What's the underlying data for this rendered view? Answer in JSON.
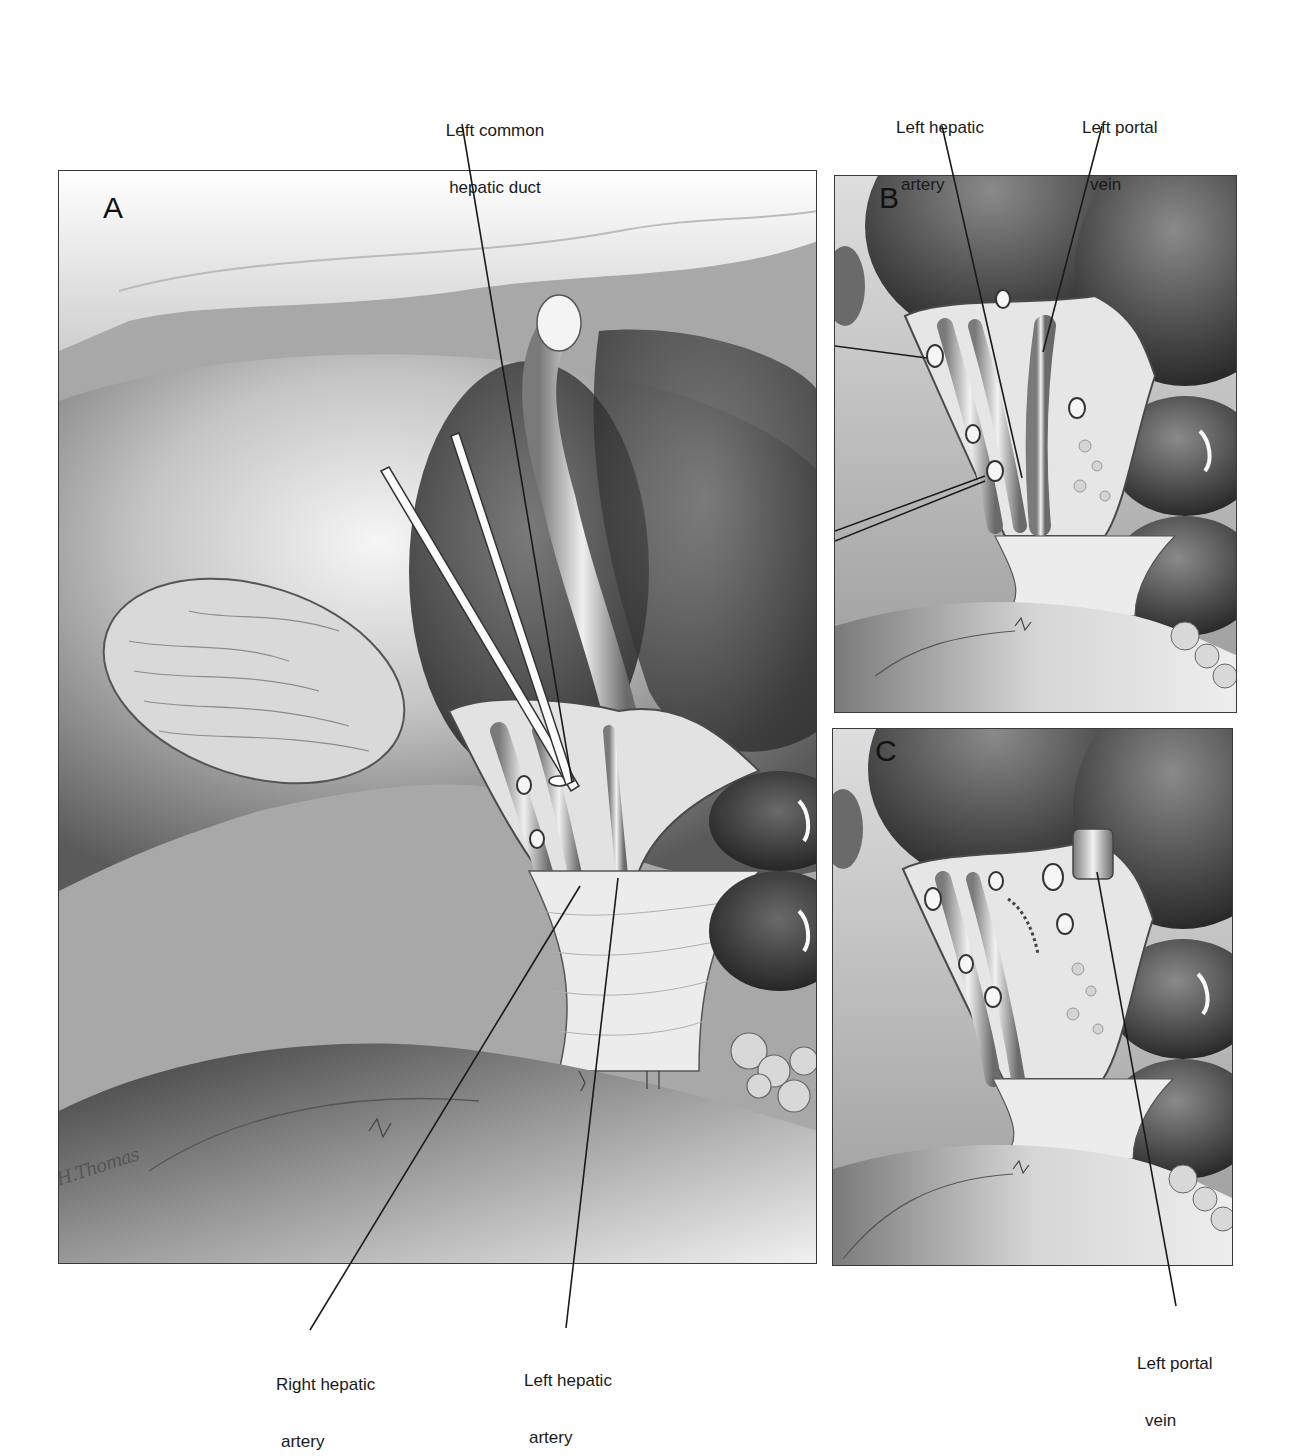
{
  "figure": {
    "colors": {
      "background": "#ffffff",
      "border": "#3a3a3a",
      "tissue_light": "#efefef",
      "tissue_mid": "#9a9a9a",
      "tissue_dark": "#3c3c3c",
      "leader_line": "#1a1a1a"
    }
  },
  "panels": [
    {
      "id": "A",
      "letter": "A"
    },
    {
      "id": "B",
      "letter": "B"
    },
    {
      "id": "C",
      "letter": "C"
    }
  ],
  "labels": {
    "left_common_hepatic_duct": {
      "line1": "Left common",
      "line2": "hepatic duct"
    },
    "b_left_hepatic_artery": {
      "line1": "Left hepatic",
      "line2": "artery"
    },
    "b_left_portal_vein": {
      "line1": "Left portal",
      "line2": "vein"
    },
    "a_right_hepatic_artery": {
      "line1": "Right hepatic",
      "line2": "artery"
    },
    "a_left_hepatic_artery": {
      "line1": "Left hepatic",
      "line2": "artery"
    },
    "c_left_portal_vein": {
      "line1": "Left portal",
      "line2": "vein"
    }
  },
  "signature": "H.Thomas"
}
